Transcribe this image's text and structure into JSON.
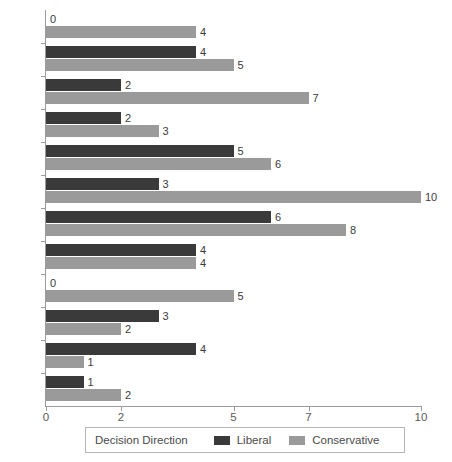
{
  "chart_data": {
    "type": "bar",
    "orientation": "horizontal",
    "title": "",
    "xlabel": "",
    "ylabel": "",
    "xlim": [
      0,
      10
    ],
    "xticks": [
      0,
      2,
      5,
      7,
      10
    ],
    "xtick_labels": [
      "0",
      "2",
      "5",
      "7",
      "10"
    ],
    "grid": false,
    "legend_position": "bottom",
    "legend_title": "Decision Direction",
    "categories": [
      "1929",
      "1930",
      "1931",
      "1932",
      "1933",
      "1934",
      "1935",
      "1936",
      "1937",
      "1938",
      "1939",
      "1940"
    ],
    "series": [
      {
        "name": "Liberal",
        "color": "#3a3a3a",
        "values": [
          0,
          4,
          2,
          2,
          5,
          3,
          6,
          4,
          0,
          3,
          4,
          1
        ]
      },
      {
        "name": "Conservative",
        "color": "#9a9a9a",
        "values": [
          4,
          5,
          7,
          3,
          6,
          10,
          8,
          4,
          5,
          2,
          1,
          2
        ]
      }
    ]
  },
  "axis": {
    "line_color": "#9b9b9b"
  }
}
